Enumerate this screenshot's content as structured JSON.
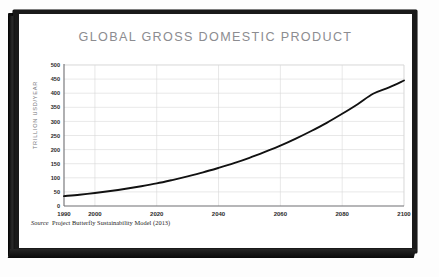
{
  "frame": {
    "border_color": "#1a1a1a",
    "paper_color": "#ffffff"
  },
  "chart_data": {
    "type": "line",
    "title": "GLOBAL GROSS DOMESTIC PRODUCT",
    "xlabel": "",
    "ylabel": "TRILLION USD/YEAR",
    "xlim": [
      1990,
      2100
    ],
    "ylim": [
      0,
      500
    ],
    "grid": true,
    "legend": null,
    "line_color": "#111111",
    "grid_color": "#d9d9d9",
    "x_ticks": [
      1990,
      2000,
      2020,
      2040,
      2060,
      2080,
      2100
    ],
    "x_tick_labels": [
      "1990",
      "2000",
      "2020",
      "2040",
      "2060",
      "2080",
      "2100"
    ],
    "y_ticks": [
      0,
      50,
      100,
      150,
      200,
      250,
      300,
      350,
      400,
      450,
      500
    ],
    "y_tick_labels": [
      "0",
      "50",
      "100",
      "150",
      "200",
      "250",
      "300",
      "350",
      "400",
      "450",
      "500"
    ],
    "series": [
      {
        "name": "Global GDP",
        "x": [
          1990,
          1995,
          2000,
          2005,
          2010,
          2015,
          2020,
          2025,
          2030,
          2035,
          2040,
          2045,
          2050,
          2055,
          2060,
          2065,
          2070,
          2075,
          2080,
          2085,
          2090,
          2095,
          2100
        ],
        "values": [
          35,
          40,
          46,
          53,
          61,
          70,
          80,
          92,
          105,
          119,
          135,
          152,
          171,
          192,
          214,
          239,
          266,
          295,
          327,
          361,
          398,
          420,
          445
        ]
      }
    ],
    "annotations": []
  },
  "source": {
    "label": "Source",
    "text": "Project Butterfly Sustainability Model (2013)"
  }
}
